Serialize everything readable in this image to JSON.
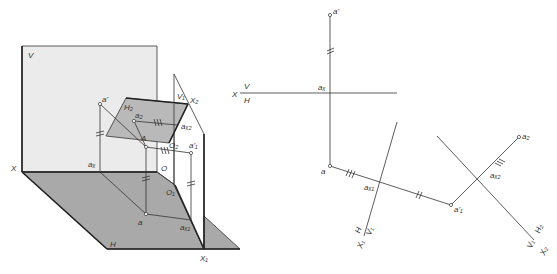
{
  "figure": {
    "left_title": "Pictorial view: point A projected onto V, H, V1, H2 planes",
    "right_title": "Orthographic epure: change of projection planes",
    "colors": {
      "background": "#ffffff",
      "v_plane_fill": "#ebebeb",
      "h_plane_fill": "#a9a9a9",
      "h2_plane_fill": "#b9b9b9",
      "line": "#333333"
    }
  },
  "left": {
    "labels": {
      "V": "V",
      "H": "H",
      "X": "X",
      "O": "O",
      "O1": "O₁",
      "O2": "O₂",
      "X1": "X₁",
      "X2": "X₂",
      "V1": "V₁",
      "H2": "H₂",
      "A": "A",
      "a_prime": "a'",
      "a": "a",
      "a2": "a₂",
      "ax": "aₓ",
      "ax1": "aₓ₁",
      "ax2": "aₓ₂",
      "a1_prime": "a'₁"
    }
  },
  "right": {
    "labels": {
      "X": "X",
      "V": "V",
      "H": "H",
      "a_prime": "a'",
      "ax": "aₓ",
      "a": "a",
      "ax1": "aₓ₁",
      "a1_prime": "a'₁",
      "ax2": "aₓ₂",
      "a2": "a₂",
      "H_axis1": "H",
      "V1_axis1": "V₁",
      "X1": "X₁",
      "H2": "H₂",
      "V1_axis2": "V₁",
      "X2": "X₂"
    }
  }
}
